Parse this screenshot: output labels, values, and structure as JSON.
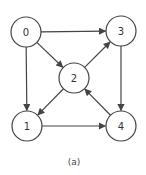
{
  "diagram": {
    "type": "directed-graph",
    "caption": "(a)",
    "colors": {
      "stroke": "#444444",
      "fill": "#ffffff",
      "text": "#333333"
    },
    "node_radius": 15,
    "nodes": [
      {
        "id": "0",
        "label": "0",
        "x": 26,
        "y": 32
      },
      {
        "id": "1",
        "label": "1",
        "x": 27,
        "y": 126
      },
      {
        "id": "2",
        "label": "2",
        "x": 74,
        "y": 78
      },
      {
        "id": "3",
        "label": "3",
        "x": 121,
        "y": 31
      },
      {
        "id": "4",
        "label": "4",
        "x": 121,
        "y": 126
      }
    ],
    "edges": [
      {
        "from": "0",
        "to": "3"
      },
      {
        "from": "0",
        "to": "2"
      },
      {
        "from": "0",
        "to": "1"
      },
      {
        "from": "2",
        "to": "3"
      },
      {
        "from": "2",
        "to": "1"
      },
      {
        "from": "3",
        "to": "4"
      },
      {
        "from": "4",
        "to": "2"
      },
      {
        "from": "1",
        "to": "4"
      }
    ]
  }
}
